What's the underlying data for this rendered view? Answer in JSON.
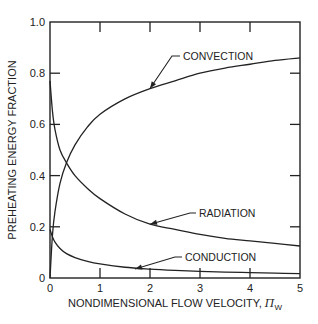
{
  "chart_data": {
    "type": "line",
    "title": "",
    "xlabel": "NONDIMENSIONAL FLOW VELOCITY, Π_W",
    "xlabel_main": "NONDIMENSIONAL FLOW VELOCITY, ",
    "xlabel_symbol": "Π",
    "xlabel_subscript": "W",
    "ylabel": "PREHEATING ENERGY FRACTION",
    "xlim": [
      0,
      5
    ],
    "ylim": [
      0,
      1.0
    ],
    "x_ticks": [
      "0",
      "1",
      "2",
      "3",
      "4",
      "5"
    ],
    "y_ticks": [
      "0",
      "0.2",
      "0.4",
      "0.6",
      "0.8",
      "1.0"
    ],
    "grid": false,
    "legend": "inline annotations with arrows",
    "series": [
      {
        "name": "CONVECTION",
        "x": [
          0,
          0.05,
          0.1,
          0.2,
          0.33,
          0.5,
          0.75,
          1.0,
          1.5,
          2.0,
          2.5,
          3.0,
          3.5,
          4.0,
          4.5,
          5.0
        ],
        "y": [
          0,
          0.17,
          0.26,
          0.37,
          0.45,
          0.52,
          0.59,
          0.64,
          0.7,
          0.74,
          0.77,
          0.8,
          0.82,
          0.835,
          0.85,
          0.86
        ]
      },
      {
        "name": "RADIATION",
        "x": [
          0,
          0.05,
          0.1,
          0.2,
          0.33,
          0.5,
          0.75,
          1.0,
          1.5,
          2.0,
          2.5,
          3.0,
          3.5,
          4.0,
          4.5,
          5.0
        ],
        "y": [
          0.77,
          0.65,
          0.58,
          0.5,
          0.45,
          0.4,
          0.35,
          0.31,
          0.25,
          0.21,
          0.19,
          0.17,
          0.155,
          0.145,
          0.135,
          0.125
        ]
      },
      {
        "name": "CONDUCTION",
        "x": [
          0,
          0.05,
          0.1,
          0.2,
          0.33,
          0.5,
          0.75,
          1.0,
          1.5,
          2.0,
          2.5,
          3.0,
          3.5,
          4.0,
          4.5,
          5.0
        ],
        "y": [
          0.19,
          0.16,
          0.14,
          0.115,
          0.095,
          0.08,
          0.065,
          0.055,
          0.042,
          0.035,
          0.03,
          0.026,
          0.023,
          0.021,
          0.019,
          0.017
        ]
      }
    ],
    "annotations": [
      {
        "text": "CONVECTION",
        "points_to": [
          2.0,
          0.74
        ]
      },
      {
        "text": "RADIATION",
        "points_to": [
          2.0,
          0.21
        ]
      },
      {
        "text": "CONDUCTION",
        "points_to": [
          1.7,
          0.035
        ]
      }
    ]
  }
}
